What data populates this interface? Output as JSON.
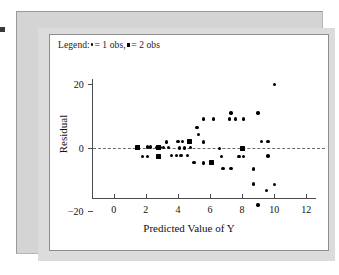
{
  "legend": {
    "prefix": "Legend:",
    "entry_one": "= 1 obs,",
    "entry_two": "= 2 obs",
    "marker_one_name": "single-observation-dot",
    "marker_two_name": "double-observation-square"
  },
  "colors": {
    "page_background": "#ffffff",
    "figure_frame": "#d4d4d4",
    "plot_background": "#ffffff",
    "axis": "#4d4d4d",
    "marker": "#000000",
    "zero_line": "#6b6b6b"
  },
  "chart_data": {
    "type": "scatter",
    "title": "",
    "xlabel": "Predicted Value of Y",
    "ylabel": "Residual",
    "xlim": [
      -0.6,
      12.6
    ],
    "ylim": [
      -23,
      23
    ],
    "xticks": [
      0,
      2,
      4,
      6,
      8,
      10,
      12
    ],
    "xtick_labels": [
      "0",
      "2",
      "4",
      "6",
      "8",
      "10",
      "12"
    ],
    "yticks": [
      20,
      0,
      -20
    ],
    "ytick_labels": [
      "20",
      "0",
      "−20"
    ],
    "grid": false,
    "legend_position": "top-left-inside",
    "reference_lines": [
      {
        "axis": "y",
        "value": 0,
        "style": "dashed"
      }
    ],
    "series": [
      {
        "name": "1 obs",
        "marker": "dot",
        "points": [
          [
            1.5,
            0.0
          ],
          [
            1.8,
            -2.8
          ],
          [
            2.1,
            -2.8
          ],
          [
            2.1,
            0.2
          ],
          [
            2.3,
            0.2
          ],
          [
            2.7,
            0.0
          ],
          [
            2.9,
            0.0
          ],
          [
            3.1,
            0.0
          ],
          [
            3.3,
            1.8
          ],
          [
            3.4,
            0.0
          ],
          [
            3.6,
            -2.6
          ],
          [
            3.9,
            -2.6
          ],
          [
            4.0,
            1.9
          ],
          [
            4.1,
            -0.2
          ],
          [
            4.2,
            -2.6
          ],
          [
            4.3,
            1.9
          ],
          [
            4.4,
            -0.2
          ],
          [
            4.6,
            -2.6
          ],
          [
            4.8,
            0.0
          ],
          [
            5.0,
            -4.8
          ],
          [
            5.2,
            6.3
          ],
          [
            5.3,
            4.2
          ],
          [
            5.6,
            1.8
          ],
          [
            5.6,
            9.0
          ],
          [
            5.6,
            -4.9
          ],
          [
            6.2,
            9.0
          ],
          [
            6.1,
            -4.9
          ],
          [
            6.6,
            -0.4
          ],
          [
            6.7,
            -2.9
          ],
          [
            6.8,
            -6.6
          ],
          [
            7.2,
            9.0
          ],
          [
            7.3,
            11.0
          ],
          [
            7.3,
            -6.7
          ],
          [
            7.6,
            9.0
          ],
          [
            7.8,
            -2.9
          ],
          [
            8.0,
            -0.2
          ],
          [
            8.1,
            -2.9
          ],
          [
            8.1,
            9.0
          ],
          [
            8.7,
            -6.8
          ],
          [
            8.7,
            -11.6
          ],
          [
            9.0,
            -18.2
          ],
          [
            9.0,
            11.0
          ],
          [
            9.2,
            1.9
          ],
          [
            9.5,
            -13.6
          ],
          [
            9.6,
            1.9
          ],
          [
            9.6,
            -2.7
          ],
          [
            10.0,
            20.0
          ],
          [
            10.0,
            -11.8
          ]
        ]
      },
      {
        "name": "2 obs",
        "marker": "square",
        "points": [
          [
            1.5,
            0.0
          ],
          [
            2.8,
            -2.8
          ],
          [
            2.8,
            0.0
          ],
          [
            4.7,
            1.9
          ],
          [
            6.1,
            -4.9
          ],
          [
            8.0,
            -0.2
          ]
        ]
      }
    ]
  }
}
